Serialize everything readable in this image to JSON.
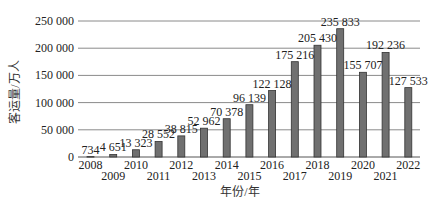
{
  "chart_data": {
    "type": "bar",
    "title": "",
    "xlabel": "年份/年",
    "ylabel": "客运量/万人",
    "ylim": [
      0,
      250000
    ],
    "yticks": [
      0,
      50000,
      100000,
      150000,
      200000,
      250000
    ],
    "ytick_labels": [
      "0",
      "50 000",
      "100 000",
      "150 000",
      "200 000",
      "250 000"
    ],
    "grid": true,
    "legend": null,
    "categories": [
      "2008",
      "2009",
      "2010",
      "2011",
      "2012",
      "2013",
      "2014",
      "2015",
      "2016",
      "2017",
      "2018",
      "2019",
      "2020",
      "2021",
      "2022"
    ],
    "values": [
      734,
      4651,
      13323,
      28552,
      38815,
      52962,
      70378,
      96139,
      122128,
      175216,
      205430,
      235833,
      155707,
      192236,
      127533
    ],
    "value_labels": [
      "734",
      "4 651",
      "13 323",
      "28 552",
      "38 815",
      "52 962",
      "70 378",
      "96 139",
      "122 128",
      "175 216",
      "205 430",
      "235 833",
      "155 707",
      "192 236",
      "127 533"
    ],
    "colors": {
      "bar_fill": "#707070",
      "bar_stroke": "#333333",
      "grid": "#8a8a8a"
    }
  }
}
